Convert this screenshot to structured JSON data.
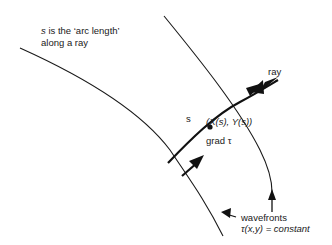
{
  "diagram": {
    "caption": {
      "line1_symbol": "s",
      "line1_text": " is the ‘arc length’",
      "line2_text": "along a ray"
    },
    "labels": {
      "ray": "ray",
      "s": "s",
      "point": "(X(s),   Y(s))",
      "grad": "grad τ",
      "wavefronts": "wavefronts",
      "wavefront_eq": "τ(x,y) = constant"
    },
    "elements": [
      {
        "type": "curve",
        "name": "left-wavefront"
      },
      {
        "type": "curve",
        "name": "right-wavefront"
      },
      {
        "type": "curve",
        "name": "ray-path",
        "arrow": "double-head"
      },
      {
        "type": "arrow",
        "name": "grad-tau-arrow"
      },
      {
        "type": "marker",
        "name": "ray-point"
      },
      {
        "type": "pointer-arrow",
        "name": "wavefront-pointer-left"
      },
      {
        "type": "pointer-arrow",
        "name": "wavefront-pointer-right"
      }
    ],
    "colors": {
      "stroke": "#1a1a1a",
      "background": "#ffffff"
    }
  }
}
